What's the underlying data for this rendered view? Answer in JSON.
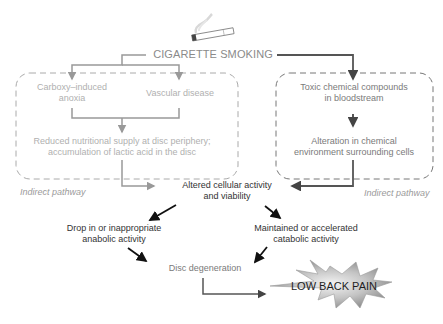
{
  "title": "CIGARETTE SMOKING",
  "icons": {
    "top": "cigarette-icon"
  },
  "left_box": {
    "node_a": {
      "line1": "Carboxy–induced",
      "line2": "anoxia"
    },
    "node_b": "Vascular disease",
    "node_c": {
      "line1": "Reduced nutritional supply at disc periphery;",
      "line2": "accumulation of lactic acid in the disc"
    },
    "pathway_label": "Indirect pathway"
  },
  "right_box": {
    "node_a": {
      "line1": "Toxic chemical compounds",
      "line2": "in bloodstream"
    },
    "node_b": {
      "line1": "Alteration in chemical",
      "line2": "environment surrounding cells"
    },
    "pathway_label": "Indirect pathway"
  },
  "center": {
    "line1": "Altered cellular activity",
    "line2": "and viability"
  },
  "left_branch": {
    "line1": "Drop in or inappropriate",
    "line2": "anabolic activity"
  },
  "right_branch": {
    "line1": "Maintained or accelerated",
    "line2": "catabolic activity"
  },
  "degeneration": "Disc degeneration",
  "outcome": "LOW BACK PAIN",
  "colors": {
    "faded": "#b0b0b0",
    "connector": "#8c8c8c",
    "dark": "#333333",
    "starburst_light": "#e8e8e8",
    "starburst_dark": "#8a8a8a"
  }
}
